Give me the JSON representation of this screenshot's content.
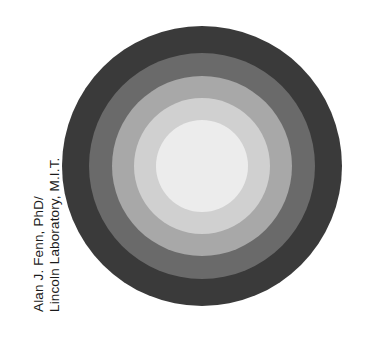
{
  "figure": {
    "name": "concentric-ring-pattern",
    "background_color": "#ffffff",
    "width": 377,
    "height": 347
  },
  "credit": {
    "line1": "Alan J. Fenn, PhD/",
    "line2": "Lincoln Laboratory, M.I.T.",
    "orientation": "rotated-90-ccw",
    "text_color": "#1b1b1b"
  },
  "chart_data": {
    "type": "pie",
    "title": "",
    "subtitle": "",
    "xlabel": "",
    "ylabel": "",
    "legend_position": "none",
    "grid": false,
    "center_x": 202,
    "center_y": 166,
    "outer_radius": 140,
    "annotations": [
      "Alan J. Fenn, PhD/",
      "Lincoln Laboratory, M.I.T."
    ],
    "categories": [
      "zone-1-outer",
      "zone-2",
      "zone-3",
      "zone-4",
      "zone-5-center"
    ],
    "values": [
      140,
      113,
      90,
      68,
      46
    ],
    "series": [
      {
        "name": "ring-radius-px",
        "values": [
          140,
          113,
          90,
          68,
          46
        ]
      },
      {
        "name": "ring-gray-level",
        "values": [
          58,
          106,
          168,
          208,
          236
        ]
      }
    ],
    "rings": [
      {
        "label": "zone-1-outer",
        "radius": 140,
        "color": "#3a3a3a",
        "gray_level": 58
      },
      {
        "label": "zone-2",
        "radius": 113,
        "color": "#6a6a6a",
        "gray_level": 106
      },
      {
        "label": "zone-3",
        "radius": 90,
        "color": "#a8a8a8",
        "gray_level": 168
      },
      {
        "label": "zone-4",
        "radius": 68,
        "color": "#d0d0d0",
        "gray_level": 208
      },
      {
        "label": "zone-5-center",
        "radius": 46,
        "color": "#ececec",
        "gray_level": 236
      }
    ]
  }
}
